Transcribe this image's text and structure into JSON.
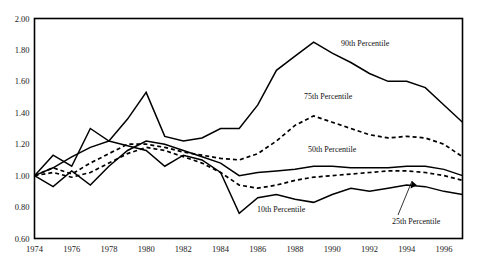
{
  "chart_data": {
    "type": "line",
    "title": "",
    "subtitle": "",
    "xlabel": "",
    "ylabel": "",
    "xlim": [
      1974,
      1997
    ],
    "ylim": [
      0.6,
      2.0
    ],
    "grid": false,
    "legend_position": "inline-annotations",
    "y_ticks": [
      "2.00",
      "1.80",
      "1.60",
      "1.40",
      "1.20",
      "1.00",
      "0.80",
      "0.60"
    ],
    "y_tick_values": [
      2.0,
      1.8,
      1.6,
      1.4,
      1.2,
      1.0,
      0.8,
      0.6
    ],
    "x_ticks": [
      "1974",
      "1976",
      "1978",
      "1980",
      "1982",
      "1984",
      "1986",
      "1988",
      "1990",
      "1992",
      "1994",
      "1996"
    ],
    "x_tick_values": [
      1974,
      1976,
      1978,
      1980,
      1982,
      1984,
      1986,
      1988,
      1990,
      1992,
      1994,
      1996
    ],
    "x": [
      1974,
      1975,
      1976,
      1977,
      1978,
      1979,
      1980,
      1981,
      1982,
      1983,
      1984,
      1985,
      1986,
      1987,
      1988,
      1989,
      1990,
      1991,
      1992,
      1993,
      1994,
      1995,
      1996,
      1997
    ],
    "series": [
      {
        "name": "90th Percentile",
        "style": "solid",
        "values": [
          1.0,
          1.13,
          1.06,
          1.3,
          1.22,
          1.36,
          1.53,
          1.25,
          1.22,
          1.24,
          1.3,
          1.3,
          1.45,
          1.67,
          1.76,
          1.85,
          1.78,
          1.72,
          1.65,
          1.6,
          1.6,
          1.56,
          1.45,
          1.34
        ]
      },
      {
        "name": "75th Percentile",
        "style": "dashed",
        "values": [
          1.0,
          1.05,
          1.01,
          1.08,
          1.14,
          1.2,
          1.2,
          1.18,
          1.15,
          1.13,
          1.11,
          1.1,
          1.14,
          1.22,
          1.32,
          1.38,
          1.34,
          1.3,
          1.26,
          1.24,
          1.25,
          1.24,
          1.2,
          1.12
        ]
      },
      {
        "name": "50th Percentile",
        "style": "solid",
        "values": [
          1.0,
          0.93,
          1.03,
          0.94,
          1.06,
          1.16,
          1.22,
          1.2,
          1.16,
          1.12,
          1.08,
          1.0,
          1.02,
          1.03,
          1.04,
          1.06,
          1.06,
          1.05,
          1.05,
          1.05,
          1.06,
          1.06,
          1.04,
          1.0
        ]
      },
      {
        "name": "25th Percentile",
        "style": "dashed",
        "values": [
          1.0,
          1.02,
          0.99,
          1.02,
          1.08,
          1.14,
          1.18,
          1.16,
          1.12,
          1.08,
          1.02,
          0.94,
          0.92,
          0.94,
          0.97,
          0.99,
          1.0,
          1.01,
          1.02,
          1.03,
          1.03,
          1.02,
          1.0,
          0.97
        ]
      },
      {
        "name": "10th Percentile",
        "style": "solid",
        "values": [
          1.0,
          1.05,
          1.12,
          1.18,
          1.22,
          1.19,
          1.16,
          1.06,
          1.13,
          1.1,
          1.02,
          0.76,
          0.86,
          0.88,
          0.85,
          0.83,
          0.88,
          0.92,
          0.9,
          0.92,
          0.94,
          0.93,
          0.9,
          0.88
        ]
      }
    ],
    "annotations": [
      {
        "text": "90th Percentile",
        "x_px": 341,
        "y_px": 46,
        "leader": false
      },
      {
        "text": "75th Percentile",
        "x_px": 304,
        "y_px": 99,
        "leader": false
      },
      {
        "text": "50th Percentile",
        "x_px": 308,
        "y_px": 152,
        "leader": false
      },
      {
        "text": "10th Percentile",
        "x_px": 257,
        "y_px": 212,
        "leader": false
      },
      {
        "text": "25th Percentile",
        "x_px": 392,
        "y_px": 224,
        "leader": true
      }
    ]
  }
}
